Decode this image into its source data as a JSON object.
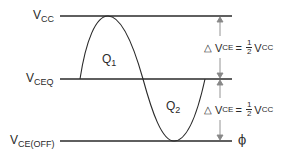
{
  "diagram": {
    "type": "waveform",
    "levels": [
      {
        "name": "vcc",
        "label_main": "V",
        "label_sub": "CC",
        "y": 16
      },
      {
        "name": "vceq",
        "label_main": "V",
        "label_sub": "CEQ",
        "y": 79
      },
      {
        "name": "vce_off",
        "label_main": "V",
        "label_sub": "CE(OFF)",
        "y": 141
      }
    ],
    "regions": [
      {
        "name": "q1",
        "label_main": "Q",
        "label_sub": "1"
      },
      {
        "name": "q2",
        "label_main": "Q",
        "label_sub": "2"
      }
    ],
    "annotations": {
      "upper": {
        "delta": "△",
        "lhs_main": "V",
        "lhs_sub": "CE",
        "equals": "=",
        "num": "1",
        "den": "2",
        "rhs_main": "V",
        "rhs_sub": "CC"
      },
      "lower": {
        "delta": "△",
        "lhs_main": "V",
        "lhs_sub": "CE",
        "equals": "=",
        "num": "1",
        "den": "2",
        "rhs_main": "V",
        "rhs_sub": "CC"
      }
    },
    "ground_symbol": "ϕ",
    "colors": {
      "line": "#2a2a2a",
      "arrow": "#888888",
      "background": "#ffffff"
    }
  }
}
